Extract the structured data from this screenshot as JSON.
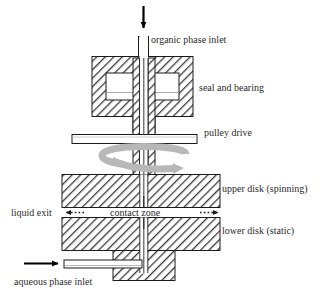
{
  "figure": {
    "type": "technical-cross-section-diagram",
    "width": 329,
    "height": 297,
    "background_color": "#ffffff",
    "line_color": "#2b2b2b",
    "hatch_color": "#3a3a3a",
    "rotation_arrow_color": "#b3b3b3",
    "text_color": "#2b2b2b"
  },
  "labels": {
    "organic_phase_inlet": "organic phase inlet",
    "seal_and_bearing": "seal and bearing",
    "pulley_drive": "pulley drive",
    "upper_disk": "upper disk (spinning)",
    "contact_zone": "contact zone",
    "liquid_exit": "liquid exit",
    "lower_disk": "lower disk (static)",
    "aqueous_phase_inlet": "aqueous phase inlet"
  },
  "components": {
    "feed_arrow_top": {
      "direction": "down",
      "style": "solid-black"
    },
    "organic_inlet_tube": {
      "fill": "white",
      "outline": "black"
    },
    "seal_housing": {
      "fill": "hatched",
      "has_inner_cavity": true
    },
    "hollow_shaft": {
      "fill": "hatched",
      "bore": "white"
    },
    "pulley_disk": {
      "fill": "white",
      "outline": "black"
    },
    "rotation_arrow": {
      "direction": "clockwise",
      "style": "gray-curved"
    },
    "upper_disk_block": {
      "fill": "hatched",
      "state": "spinning"
    },
    "lower_disk_block": {
      "fill": "hatched",
      "state": "static"
    },
    "contact_gap": {
      "fill": "white"
    },
    "exit_arrow_left": {
      "direction": "left",
      "style": "dotted-with-head"
    },
    "exit_arrow_right": {
      "direction": "right",
      "style": "dotted-with-head"
    },
    "aqueous_feed_arrow": {
      "direction": "right",
      "style": "solid-black"
    },
    "aqueous_inlet_tube": {
      "fill": "white",
      "outline": "black"
    }
  }
}
